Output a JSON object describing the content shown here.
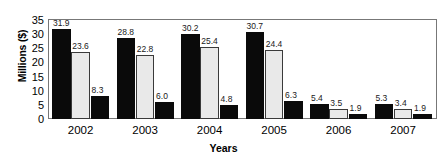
{
  "chart_data": {
    "type": "bar",
    "title": "",
    "xlabel": "Years",
    "ylabel": "Millions ($)",
    "categories": [
      "2002",
      "2003",
      "2004",
      "2005",
      "2006",
      "2007"
    ],
    "series": [
      {
        "name": "series-1",
        "color": "#0a0a0a",
        "values": [
          31.9,
          28.8,
          30.2,
          30.7,
          5.4,
          5.3
        ]
      },
      {
        "name": "series-2",
        "color": "#e9e9e9",
        "values": [
          23.6,
          22.8,
          25.4,
          24.4,
          3.5,
          3.4
        ]
      },
      {
        "name": "series-3",
        "color": "#0a0a0a",
        "values": [
          8.3,
          6.0,
          4.8,
          6.3,
          1.9,
          1.9
        ]
      }
    ],
    "data_labels": [
      [
        "31.9",
        "23.6",
        "8.3"
      ],
      [
        "28.8",
        "22.8",
        "6.0"
      ],
      [
        "30.2",
        "25.4",
        "4.8"
      ],
      [
        "30.7",
        "24.4",
        "6.3"
      ],
      [
        "5.4",
        "3.5",
        "1.9"
      ],
      [
        "5.3",
        "3.4",
        "1.9"
      ]
    ],
    "yticks": [
      "35",
      "30",
      "25",
      "20",
      "15",
      "10",
      "5",
      "0"
    ],
    "ytick_values": [
      35,
      30,
      25,
      20,
      15,
      10,
      5,
      0
    ],
    "ylim": [
      0,
      35
    ],
    "grid": false,
    "legend": "none"
  }
}
